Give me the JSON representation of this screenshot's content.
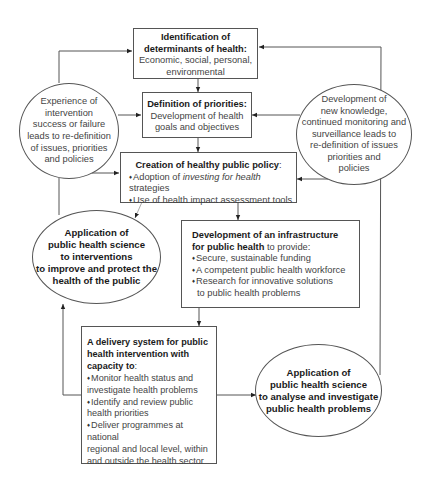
{
  "diagram": {
    "box_determinants": {
      "title_line1": "Identification of",
      "title_line2": "determinants of health:",
      "body_line1": "Economic, social, personal,",
      "body_line2": "environmental"
    },
    "box_priorities": {
      "title": "Definition of priorities:",
      "body_line1": "Development of health",
      "body_line2": "goals and objectives"
    },
    "box_policy": {
      "title": "Creation of healthy public policy",
      "title_suffix": ":",
      "bullet1_pre": "Adoption of ",
      "bullet1_italic": "investing for health",
      "bullet1_post": " strategies",
      "bullet2": "Use of health impact assessment tools"
    },
    "box_infrastructure": {
      "title_line1": "Development of an infrastructure",
      "title_line2_bold": "for public health",
      "title_line2_rest": " to provide:",
      "bullets": [
        "Secure, sustainable funding",
        "A competent public health workforce",
        "Research for innovative solutions"
      ],
      "bullet3_continuation": "to public health problems"
    },
    "box_delivery": {
      "title_line1": "A delivery system for public",
      "title_line2": "health intervention with",
      "title_line3": "capacity to",
      "title_suffix": ":",
      "bullet1": "Monitor health status and",
      "bullet1_cont": "investigate health problems",
      "bullet2": "Identify and review public",
      "bullet2_cont": "health priorities",
      "bullet3": "Deliver programmes at national",
      "bullet3_cont1": "regional and local level, within",
      "bullet3_cont2": "and outside the health sector"
    },
    "circle_experience": {
      "lines": [
        "Experience of",
        "intervention",
        "success or failure",
        "leads to re-definition",
        "of issues, priorities",
        "and policies"
      ]
    },
    "circle_knowledge": {
      "lines": [
        "Development of",
        "new knowledge,",
        "continued monitoring and",
        "surveillance leads to",
        "re-definition of issues",
        "priorities and",
        "policies"
      ]
    },
    "ellipse_interventions": {
      "lines": [
        "Application of",
        "public health science",
        "to interventions",
        "to improve and protect the",
        "health of the public"
      ]
    },
    "ellipse_analyse": {
      "lines": [
        "Application of",
        "public health science",
        "to analyse and investigate",
        "public health problems"
      ]
    }
  }
}
